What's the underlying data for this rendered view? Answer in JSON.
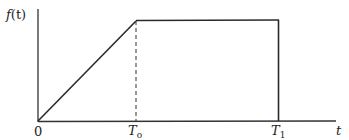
{
  "diagram": {
    "type": "piecewise-function-graph",
    "y_axis_label": "f",
    "y_axis_label_arg": "(t)",
    "x_axis_label": "t",
    "x_ticks": [
      {
        "label": "0",
        "sub": ""
      },
      {
        "label": "T",
        "sub": "o"
      },
      {
        "label": "T",
        "sub": "1"
      }
    ],
    "segments": [
      {
        "name": "ramp",
        "from": [
          0,
          0
        ],
        "to": [
          "T0",
          "max"
        ],
        "style": "solid"
      },
      {
        "name": "plateau",
        "from": [
          "T0",
          "max"
        ],
        "to": [
          "T1",
          "max"
        ],
        "style": "solid"
      },
      {
        "name": "drop",
        "from": [
          "T1",
          "max"
        ],
        "to": [
          "T1",
          0
        ],
        "style": "solid"
      },
      {
        "name": "T0-marker",
        "from": [
          "T0",
          0
        ],
        "to": [
          "T0",
          "max"
        ],
        "style": "dashed"
      }
    ],
    "colors": {
      "line": "#2a2a2a",
      "background": "#ffffff"
    }
  }
}
